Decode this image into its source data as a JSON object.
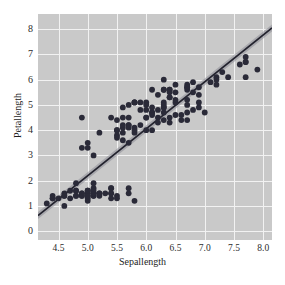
{
  "chart_data": {
    "type": "scatter",
    "title": "",
    "xlabel": "Sepallength",
    "ylabel": "Petallength",
    "xlim": [
      4.15,
      8.15
    ],
    "ylim": [
      -0.35,
      8.6
    ],
    "xticks": [
      "4.5",
      "5.0",
      "5.5",
      "6.0",
      "6.5",
      "7.0",
      "7.5",
      "8.0"
    ],
    "xtick_values": [
      4.5,
      5.0,
      5.5,
      6.0,
      6.5,
      7.0,
      7.5,
      8.0
    ],
    "yticks": [
      "0",
      "1",
      "2",
      "3",
      "4",
      "5",
      "6",
      "7",
      "8"
    ],
    "ytick_values": [
      0,
      1,
      2,
      3,
      4,
      5,
      6,
      7,
      8
    ],
    "grid": true,
    "grid_color": "#f2f2f2",
    "background_color": "#c9c9c9",
    "point_color": "#2a2a38",
    "line_color": "#23232e",
    "band_color": "#8d8d96",
    "legend": "none",
    "marker_size": 2.9,
    "regression": {
      "label": "linear fit",
      "slope": 1.858,
      "intercept": -7.095,
      "x_start": 4.15,
      "x_end": 8.15,
      "y_start": 0.62,
      "y_end": 8.05,
      "band_halfwidth": 0.14
    },
    "series": [
      {
        "name": "iris",
        "x": [
          5.1,
          4.9,
          4.7,
          4.6,
          5.0,
          5.4,
          4.6,
          5.0,
          4.4,
          4.9,
          5.4,
          4.8,
          4.8,
          4.3,
          5.8,
          5.7,
          5.4,
          5.1,
          5.7,
          5.1,
          5.4,
          5.1,
          4.6,
          5.1,
          4.8,
          5.0,
          5.0,
          5.2,
          5.2,
          4.7,
          4.8,
          5.4,
          5.2,
          5.5,
          4.9,
          5.0,
          5.5,
          4.9,
          4.4,
          5.1,
          5.0,
          4.5,
          4.4,
          5.0,
          5.1,
          4.8,
          5.1,
          4.6,
          5.3,
          5.0,
          7.0,
          6.4,
          6.9,
          5.5,
          6.5,
          5.7,
          6.3,
          4.9,
          6.6,
          5.2,
          5.0,
          5.9,
          6.0,
          6.1,
          5.6,
          6.7,
          5.6,
          5.8,
          6.2,
          5.6,
          5.9,
          6.1,
          6.3,
          6.1,
          6.4,
          6.6,
          6.8,
          6.7,
          6.0,
          5.7,
          5.5,
          5.5,
          5.8,
          6.0,
          5.4,
          6.0,
          6.7,
          6.3,
          5.6,
          5.5,
          5.5,
          6.1,
          5.8,
          5.0,
          5.6,
          5.7,
          5.7,
          6.2,
          5.1,
          5.7,
          6.3,
          5.8,
          7.1,
          6.3,
          6.5,
          7.6,
          4.9,
          7.3,
          6.7,
          7.2,
          6.5,
          6.4,
          6.8,
          5.7,
          5.8,
          6.4,
          6.5,
          7.7,
          7.7,
          6.0,
          6.9,
          5.6,
          7.7,
          6.3,
          6.7,
          7.2,
          6.2,
          6.1,
          6.4,
          7.2,
          7.4,
          7.9,
          6.4,
          6.3,
          6.1,
          7.7,
          6.3,
          6.4,
          6.0,
          6.9,
          6.7,
          6.9,
          5.8,
          6.8,
          6.7,
          6.7,
          6.3,
          6.5,
          6.2,
          5.9
        ],
        "y": [
          1.4,
          1.4,
          1.3,
          1.5,
          1.4,
          1.7,
          1.4,
          1.5,
          1.4,
          1.5,
          1.5,
          1.6,
          1.4,
          1.1,
          1.2,
          1.5,
          1.3,
          1.4,
          1.7,
          1.5,
          1.7,
          1.5,
          1.0,
          1.7,
          1.9,
          1.6,
          1.6,
          1.5,
          1.4,
          1.6,
          1.6,
          1.5,
          1.5,
          1.4,
          1.5,
          1.2,
          1.3,
          1.4,
          1.3,
          1.5,
          1.3,
          1.3,
          1.3,
          1.6,
          1.9,
          1.4,
          1.6,
          1.4,
          1.5,
          1.4,
          4.7,
          4.5,
          4.9,
          4.0,
          4.6,
          4.5,
          4.7,
          3.3,
          4.6,
          3.9,
          3.5,
          4.2,
          4.0,
          4.7,
          3.6,
          4.4,
          4.5,
          4.1,
          4.5,
          3.9,
          4.8,
          4.0,
          4.9,
          4.7,
          4.3,
          4.4,
          4.8,
          5.0,
          4.5,
          3.5,
          3.8,
          3.7,
          3.9,
          5.1,
          4.5,
          4.5,
          4.7,
          4.4,
          4.1,
          4.0,
          4.4,
          4.6,
          4.0,
          3.3,
          4.2,
          4.2,
          4.2,
          4.3,
          3.0,
          4.1,
          6.0,
          5.1,
          5.9,
          5.6,
          5.8,
          6.6,
          4.5,
          6.3,
          5.8,
          6.1,
          5.1,
          5.3,
          5.5,
          5.0,
          5.1,
          5.3,
          5.5,
          6.7,
          6.9,
          5.0,
          5.7,
          4.9,
          6.7,
          4.9,
          5.7,
          6.0,
          4.8,
          4.9,
          5.6,
          5.8,
          6.1,
          6.4,
          5.6,
          5.1,
          5.6,
          6.1,
          5.6,
          5.5,
          4.8,
          5.4,
          5.6,
          5.1,
          5.1,
          5.9,
          5.7,
          5.2,
          5.0,
          5.2,
          5.4,
          5.1
        ]
      }
    ]
  }
}
